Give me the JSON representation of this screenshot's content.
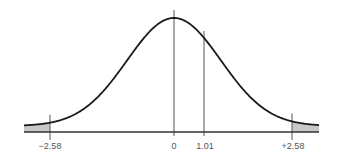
{
  "chart_data": {
    "type": "area",
    "title": "",
    "xlabel": "",
    "ylabel": "",
    "distribution": "standard normal",
    "x_markers": [
      {
        "value": -2.58,
        "label": "−2.58",
        "role": "critical-value-left"
      },
      {
        "value": 0,
        "label": "0",
        "role": "mean"
      },
      {
        "value": 1.01,
        "label": "1.01",
        "role": "test-statistic"
      },
      {
        "value": 2.58,
        "label": "+2.58",
        "role": "critical-value-right"
      }
    ],
    "shaded_regions": [
      {
        "from": "-inf",
        "to": -2.58,
        "color": "#c8c8c8"
      },
      {
        "from": 2.58,
        "to": "inf",
        "color": "#c8c8c8"
      }
    ],
    "grid": false,
    "legend": null
  },
  "colors": {
    "curve": "#1a1a1a",
    "axis": "#333333",
    "marker_lines": "#555555",
    "shade": "#c8c8c8",
    "label": "#555555"
  },
  "labels": {
    "left_critical": "−2.58",
    "mean": "0",
    "test_stat": "1.01",
    "right_critical": "+2.58"
  }
}
